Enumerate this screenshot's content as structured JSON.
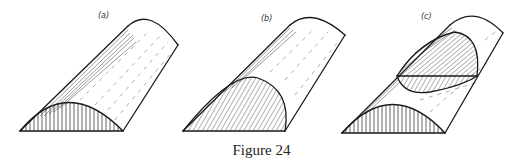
{
  "figure": {
    "caption": "Figure 24",
    "panels": [
      {
        "id": "a",
        "label": "(a)",
        "description": "Half-cylinder solid with vertically hatched semicircular cross-section at the front base"
      },
      {
        "id": "b",
        "label": "(b)",
        "description": "Half-cylinder solid with obliquely hatched elliptical section cutting from the base"
      },
      {
        "id": "c",
        "label": "(c)",
        "description": "Half-cylinder solid with vertically hatched front cross-section and an oblique elliptical plane section higher up"
      }
    ]
  },
  "colors": {
    "ink": "#1a1a1a",
    "background": "#ffffff"
  }
}
